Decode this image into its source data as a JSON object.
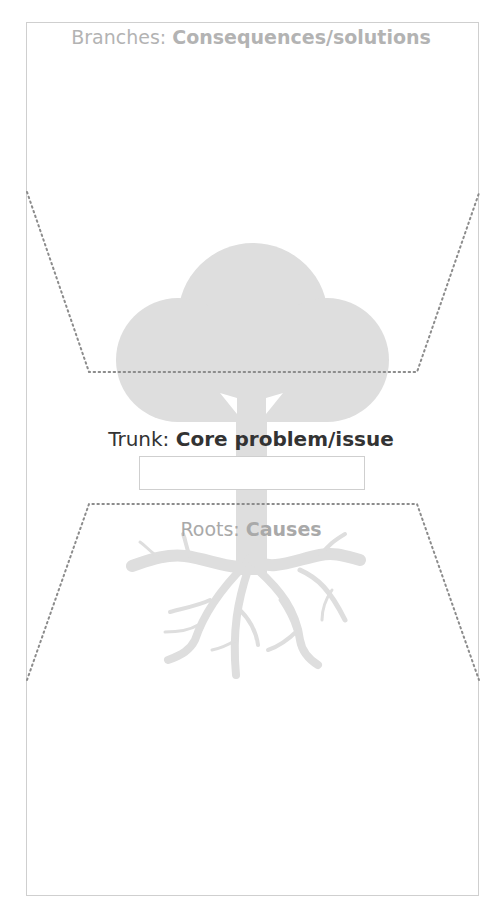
{
  "diagram": {
    "type": "problem-tree",
    "colors": {
      "tree_fill": "#dedede",
      "frame_border": "#cfcfcf",
      "dotted_line": "#8c8c8c",
      "branches_text": "#b3b3b3",
      "trunk_text": "#333333",
      "roots_text": "#a9a9a9"
    },
    "sections": {
      "branches": {
        "label_prefix": "Branches: ",
        "label_bold": "Consequences/solutions"
      },
      "trunk": {
        "label_prefix": "Trunk: ",
        "label_bold": "Core problem/issue",
        "input_value": "",
        "input_placeholder": ""
      },
      "roots": {
        "label_prefix": "Roots: ",
        "label_bold": "Causes"
      }
    }
  }
}
